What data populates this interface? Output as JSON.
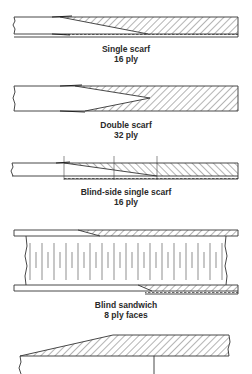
{
  "figure": {
    "type": "technical-diagram",
    "colors": {
      "line": "#333333",
      "hatch": "#444444",
      "background": "#ffffff",
      "text": "#2a2a2a"
    }
  },
  "panels": [
    {
      "id": "single-scarf",
      "title": "Single scarf",
      "subtitle": "16 ply"
    },
    {
      "id": "double-scarf",
      "title": "Double scarf",
      "subtitle": "32 ply"
    },
    {
      "id": "blind-side-single-scarf",
      "title": "Blind-side single scarf",
      "subtitle": "16 ply"
    },
    {
      "id": "blind-sandwich",
      "title": "Blind sandwich",
      "subtitle": "8 ply faces"
    },
    {
      "id": "partial-bottom-panel",
      "title": "",
      "subtitle": ""
    }
  ]
}
